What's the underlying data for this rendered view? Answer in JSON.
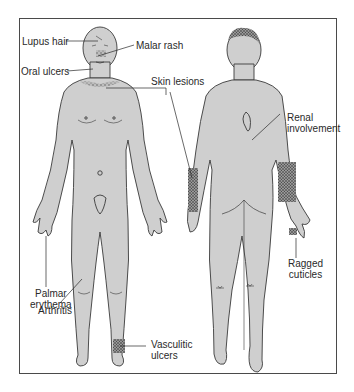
{
  "figure": {
    "type": "anatomical-diagram",
    "colors": {
      "body_fill": "#cfcfcf",
      "outline": "#3a3a3a",
      "frame": "#4a4a4a",
      "lesion": "#555555",
      "text": "#2a2a2a"
    },
    "views": [
      "anterior",
      "posterior"
    ]
  },
  "labels": {
    "lupus_hair": "Lupus hair",
    "malar_rash": "Malar rash",
    "oral_ulcers": "Oral ulcers",
    "skin_lesions": "Skin lesions",
    "renal_line1": "Renal",
    "renal_line2": "involvement",
    "palmar_line1": "Palmar",
    "palmar_line2": "erythema",
    "arthritis": "Arthritis",
    "vasculitic_line1": "Vasculitic",
    "vasculitic_line2": "ulcers",
    "ragged_line1": "Ragged",
    "ragged_line2": "cuticles"
  }
}
